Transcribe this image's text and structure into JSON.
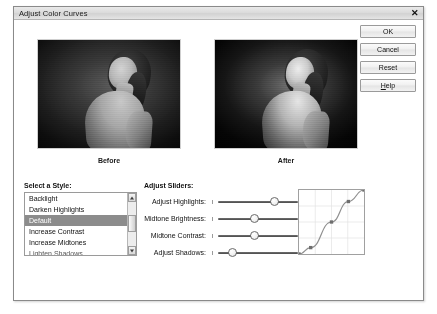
{
  "window": {
    "title": "Adjust Color Curves",
    "close_icon": "close-icon",
    "close_glyph": "✕"
  },
  "buttons": [
    {
      "id": "ok",
      "label": "OK"
    },
    {
      "id": "cancel",
      "label": "Cancel"
    },
    {
      "id": "reset",
      "label": "Reset"
    },
    {
      "id": "help",
      "label": "Help",
      "accel": "H"
    }
  ],
  "previews": {
    "before_caption": "Before",
    "after_caption": "After"
  },
  "style_panel": {
    "title": "Select a Style:",
    "items": [
      {
        "label": "Backlight",
        "selected": false
      },
      {
        "label": "Darken Highlights",
        "selected": false
      },
      {
        "label": "Default",
        "selected": true
      },
      {
        "label": "Increase Contrast",
        "selected": false
      },
      {
        "label": "Increase Midtones",
        "selected": false
      },
      {
        "label": "Lighten Shadows",
        "selected": false
      }
    ],
    "scrollbar": {
      "up_icon": "chevron-up-icon",
      "down_icon": "chevron-down-icon"
    }
  },
  "sliders_panel": {
    "title": "Adjust Sliders:",
    "sliders": [
      {
        "label": "Adjust Highlights:",
        "value": 70
      },
      {
        "label": "Midtone Brightness:",
        "value": 45
      },
      {
        "label": "Midtone Contrast:",
        "value": 45
      },
      {
        "label": "Adjust Shadows:",
        "value": 18
      }
    ]
  },
  "curve": {
    "name": "tone-curve-graph",
    "points": [
      {
        "x": 0,
        "y": 0
      },
      {
        "x": 18,
        "y": 10
      },
      {
        "x": 50,
        "y": 50
      },
      {
        "x": 76,
        "y": 82
      },
      {
        "x": 100,
        "y": 100
      }
    ],
    "grid": true,
    "grid_divisions": 4
  },
  "colors": {
    "dialog_bg": "#ffffff",
    "dialog_border": "#8a8a8a",
    "titlebar": "#dcdcdc",
    "selection": "#8c8c8c",
    "button_face": "#f0f0f0",
    "curve_line": "#8f8f8f",
    "curve_point": "#6e6e6e"
  }
}
